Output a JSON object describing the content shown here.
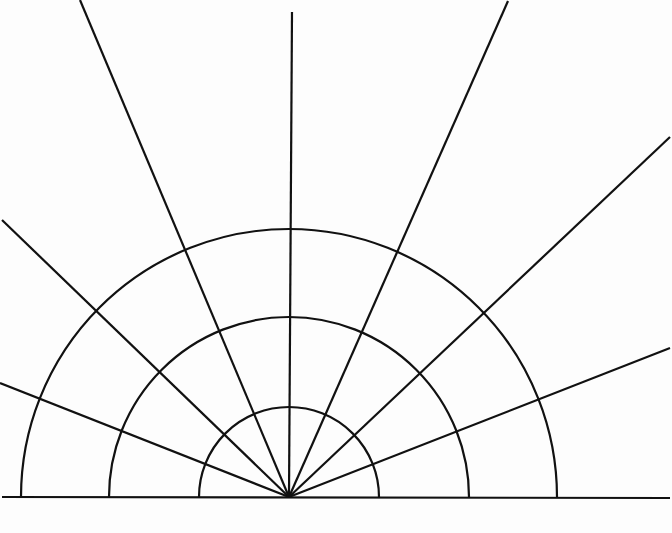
{
  "diagram": {
    "type": "polar-half-grid",
    "stroke_color": "#111111",
    "background": "#fdfdfd",
    "center": [
      289,
      497
    ],
    "baseline": {
      "x1": 2,
      "y1": 497,
      "x2": 670,
      "y2": 498
    },
    "arcs": [
      {
        "name": "inner-arc",
        "radius": 90
      },
      {
        "name": "middle-arc",
        "radius": 180
      },
      {
        "name": "outer-arc",
        "radius": 268
      }
    ],
    "rays": [
      {
        "name": "ray-left-low",
        "end": [
          0,
          383
        ]
      },
      {
        "name": "ray-left-mid",
        "end": [
          2,
          220
        ]
      },
      {
        "name": "ray-left-high",
        "end": [
          80,
          0
        ]
      },
      {
        "name": "ray-vertical",
        "end": [
          292,
          12
        ]
      },
      {
        "name": "ray-right-high",
        "end": [
          508,
          1
        ]
      },
      {
        "name": "ray-right-mid",
        "end": [
          670,
          137
        ]
      },
      {
        "name": "ray-right-low",
        "end": [
          670,
          348
        ]
      }
    ]
  }
}
